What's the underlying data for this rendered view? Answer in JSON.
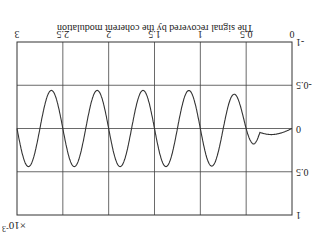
{
  "chart_data": {
    "type": "line",
    "title": "The signal recovered by the coherent modulation",
    "xlabel": "",
    "ylabel": "",
    "x_multiplier": "×10^-3",
    "x_multiplier_label": "×10",
    "x_multiplier_exp": "-3",
    "xlim": [
      0,
      0.003
    ],
    "ylim": [
      -1,
      1
    ],
    "grid": true,
    "xticks": [
      "0",
      "0.5",
      "1",
      "1.5",
      "2",
      "2.5",
      "3"
    ],
    "yticks": [
      "-1",
      "-0.5",
      "0",
      "0.5",
      "1"
    ],
    "rotation_deg": 180,
    "series": [
      {
        "name": "recovered signal",
        "color": "#333333",
        "x": [
          0.0,
          0.15,
          0.3,
          0.42,
          0.55,
          0.63,
          0.72,
          0.88,
          1.0,
          1.12,
          1.22,
          1.38,
          1.5,
          1.62,
          1.72,
          1.87,
          2.0,
          2.12,
          2.22,
          2.37,
          2.5,
          2.62,
          2.72,
          2.87,
          3.0
        ],
        "x_unit": "ms (×10^-3 s)",
        "values": [
          0.0,
          -0.01,
          0.07,
          0.02,
          -0.3,
          -0.38,
          0.0,
          0.44,
          0.0,
          -0.43,
          0.0,
          0.44,
          0.0,
          -0.43,
          0.0,
          0.44,
          0.0,
          -0.43,
          0.0,
          0.44,
          0.0,
          -0.43,
          0.0,
          0.44,
          0.27
        ]
      }
    ]
  }
}
